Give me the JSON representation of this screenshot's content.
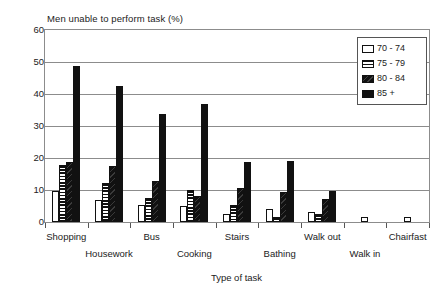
{
  "chart_data": {
    "type": "bar",
    "title": "",
    "ylabel": "Men unable to perform task (%)",
    "xlabel": "Type of task",
    "ylim": [
      0,
      60
    ],
    "yticks": [
      0,
      10,
      20,
      30,
      40,
      50,
      60
    ],
    "grid": true,
    "legend_position": "top-right",
    "categories": [
      "Shopping",
      "Housework",
      "Bus",
      "Cooking",
      "Stairs",
      "Bathing",
      "Walk out",
      "Walk in",
      "Chairfast"
    ],
    "series": [
      {
        "name": "70 - 74",
        "color": "#ffffff",
        "pattern": "solid-white",
        "values": [
          9.7,
          7.0,
          5.2,
          5.0,
          2.5,
          4.0,
          3.2,
          1.5,
          1.5
        ]
      },
      {
        "name": "75 - 79",
        "color": "#111111",
        "pattern": "horizontal-stripes",
        "values": [
          17.8,
          12.1,
          7.4,
          10.0,
          5.4,
          1.6,
          2.6,
          0.0,
          0.0
        ]
      },
      {
        "name": "80 - 84",
        "color": "#161616",
        "pattern": "dark-textured",
        "values": [
          18.7,
          17.5,
          12.8,
          8.0,
          10.5,
          9.5,
          7.1,
          0.0,
          0.0
        ]
      },
      {
        "name": "85 +",
        "color": "#111111",
        "pattern": "solid-black",
        "values": [
          48.6,
          42.6,
          33.7,
          36.8,
          18.8,
          19.0,
          9.8,
          0.0,
          0.0
        ]
      }
    ]
  },
  "legend": {
    "items": [
      {
        "label": "70 - 74"
      },
      {
        "label": "75 - 79"
      },
      {
        "label": "80 - 84"
      },
      {
        "label": "85 +"
      }
    ]
  }
}
